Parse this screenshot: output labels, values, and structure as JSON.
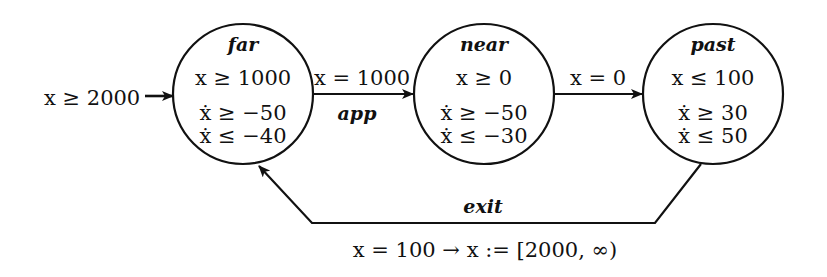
{
  "diagram": {
    "type": "hybrid-automaton",
    "initial": {
      "label": "x ≥ 2000"
    },
    "states": [
      {
        "id": "far",
        "name": "far",
        "invariant": "x ≥ 1000",
        "rate_lower": "ẋ ≥ −50",
        "rate_upper": "ẋ ≤ −40"
      },
      {
        "id": "near",
        "name": "near",
        "invariant": "x ≥ 0",
        "rate_lower": "ẋ ≥ −50",
        "rate_upper": "ẋ ≤ −30"
      },
      {
        "id": "past",
        "name": "past",
        "invariant": "x ≤ 100",
        "rate_lower": "ẋ ≥ 30",
        "rate_upper": "ẋ ≤ 50"
      }
    ],
    "transitions": [
      {
        "from": "far",
        "to": "near",
        "guard": "x = 1000",
        "event": "app"
      },
      {
        "from": "near",
        "to": "past",
        "guard": "x = 0",
        "event": ""
      },
      {
        "from": "past",
        "to": "far",
        "guard": "x = 100 → x := [2000, ∞)",
        "event": "exit"
      }
    ]
  },
  "colors": {
    "ink": "#111111",
    "background": "#ffffff"
  }
}
